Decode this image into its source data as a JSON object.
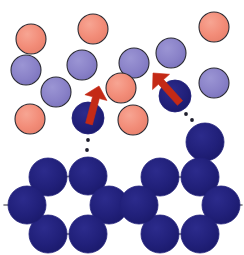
{
  "figure": {
    "title": "Monomer attachment to growing hexagonal framework",
    "caption": "",
    "width": 244,
    "height": 255,
    "background": "#ffffff"
  },
  "palette": {
    "monomer_pink": "#F28C78",
    "monomer_purple": "#8A82C8",
    "framework_blue": "#21207A",
    "circle_outline": "#2B2B33",
    "bond_line": "#6E6E78",
    "arrow_red": "#C42A16",
    "dotted_guide": "#1E1E2D"
  },
  "legend": {
    "pink_label": "pink monomer",
    "purple_label": "purple monomer",
    "blue_label": "incorporated unit",
    "arrow_label": "attachment direction",
    "dotted_label": "attachment pathway"
  },
  "geometry": {
    "solution_radius": 15,
    "framework_radius": 19,
    "outline_width": 1.1,
    "bond_width": 1.6,
    "dot_radius": 1.9
  },
  "solution_particles": [
    {
      "name": "pink-monomer-1",
      "type": "pink",
      "cx": 31,
      "cy": 39,
      "r": 15
    },
    {
      "name": "pink-monomer-2",
      "type": "pink",
      "cx": 93,
      "cy": 29,
      "r": 15
    },
    {
      "name": "pink-monomer-3",
      "type": "pink",
      "cx": 214,
      "cy": 27,
      "r": 15
    },
    {
      "name": "purple-monomer-1",
      "type": "purple",
      "cx": 26,
      "cy": 70,
      "r": 15
    },
    {
      "name": "purple-monomer-2",
      "type": "purple",
      "cx": 82,
      "cy": 65,
      "r": 15
    },
    {
      "name": "purple-monomer-3",
      "type": "purple",
      "cx": 134,
      "cy": 63,
      "r": 15
    },
    {
      "name": "purple-monomer-4",
      "type": "purple",
      "cx": 171,
      "cy": 53,
      "r": 15
    },
    {
      "name": "purple-monomer-5",
      "type": "purple",
      "cx": 56,
      "cy": 92,
      "r": 15
    },
    {
      "name": "pink-monomer-4",
      "type": "pink",
      "cx": 121,
      "cy": 88,
      "r": 15
    },
    {
      "name": "purple-monomer-6",
      "type": "purple",
      "cx": 214,
      "cy": 83,
      "r": 15
    },
    {
      "name": "pink-monomer-5",
      "type": "pink",
      "cx": 30,
      "cy": 119,
      "r": 15
    },
    {
      "name": "pink-monomer-6",
      "type": "pink",
      "cx": 133,
      "cy": 120,
      "r": 15
    }
  ],
  "attaching_units": [
    {
      "name": "attaching-unit-left",
      "cx": 88,
      "cy": 118,
      "r": 16
    },
    {
      "name": "attaching-unit-right",
      "cx": 175,
      "cy": 96,
      "r": 16
    }
  ],
  "arrows": [
    {
      "name": "attachment-arrow-left",
      "from_x": 89,
      "from_y": 124,
      "to_x": 99,
      "to_y": 86,
      "width": 7,
      "head": 12,
      "angle_deg": 75
    },
    {
      "name": "attachment-arrow-right",
      "from_x": 180,
      "from_y": 103,
      "to_x": 153,
      "to_y": 73,
      "width": 7,
      "head": 12,
      "angle_deg": 132
    }
  ],
  "guide_dots": [
    {
      "name": "guide-dot-left-1",
      "cx": 88,
      "cy": 140
    },
    {
      "name": "guide-dot-left-2",
      "cx": 87,
      "cy": 150
    },
    {
      "name": "guide-dot-left-3",
      "cx": 86,
      "cy": 160
    },
    {
      "name": "guide-dot-right-1",
      "cx": 186,
      "cy": 114
    },
    {
      "name": "guide-dot-right-2",
      "cx": 192,
      "cy": 120
    },
    {
      "name": "guide-dot-right-3",
      "cx": 199,
      "cy": 126
    }
  ],
  "framework_nodes": [
    {
      "name": "node-pendant-right",
      "cx": 205,
      "cy": 142,
      "r": 19,
      "ring": "pendant"
    },
    {
      "name": "node-L1",
      "cx": 48,
      "cy": 177,
      "r": 19,
      "ring": "left"
    },
    {
      "name": "node-L2",
      "cx": 88,
      "cy": 176,
      "r": 19,
      "ring": "left"
    },
    {
      "name": "node-L3",
      "cx": 109,
      "cy": 205,
      "r": 19,
      "ring": "left"
    },
    {
      "name": "node-L4",
      "cx": 88,
      "cy": 234,
      "r": 19,
      "ring": "left"
    },
    {
      "name": "node-L5",
      "cx": 48,
      "cy": 234,
      "r": 19,
      "ring": "left"
    },
    {
      "name": "node-L6",
      "cx": 27,
      "cy": 205,
      "r": 19,
      "ring": "left"
    },
    {
      "name": "node-R1",
      "cx": 160,
      "cy": 177,
      "r": 19,
      "ring": "right"
    },
    {
      "name": "node-R2",
      "cx": 200,
      "cy": 177,
      "r": 19,
      "ring": "right"
    },
    {
      "name": "node-R3",
      "cx": 221,
      "cy": 205,
      "r": 19,
      "ring": "right"
    },
    {
      "name": "node-R4",
      "cx": 200,
      "cy": 234,
      "r": 19,
      "ring": "right"
    },
    {
      "name": "node-R5",
      "cx": 160,
      "cy": 234,
      "r": 19,
      "ring": "right"
    },
    {
      "name": "node-R6",
      "cx": 139,
      "cy": 205,
      "r": 19,
      "ring": "right"
    }
  ],
  "framework_bonds": [
    {
      "name": "bond-L1-L2",
      "x1": 48,
      "y1": 177,
      "x2": 88,
      "y2": 176
    },
    {
      "name": "bond-L2-L3",
      "x1": 88,
      "y1": 176,
      "x2": 109,
      "y2": 205
    },
    {
      "name": "bond-L3-L4",
      "x1": 109,
      "y1": 205,
      "x2": 88,
      "y2": 234
    },
    {
      "name": "bond-L4-L5",
      "x1": 88,
      "y1": 234,
      "x2": 48,
      "y2": 234
    },
    {
      "name": "bond-L5-L6",
      "x1": 48,
      "y1": 234,
      "x2": 27,
      "y2": 205
    },
    {
      "name": "bond-L6-L1",
      "x1": 27,
      "y1": 205,
      "x2": 48,
      "y2": 177
    },
    {
      "name": "bond-R1-R2",
      "x1": 160,
      "y1": 177,
      "x2": 200,
      "y2": 177
    },
    {
      "name": "bond-R2-R3",
      "x1": 200,
      "y1": 177,
      "x2": 221,
      "y2": 205
    },
    {
      "name": "bond-R3-R4",
      "x1": 221,
      "y1": 205,
      "x2": 200,
      "y2": 234
    },
    {
      "name": "bond-R4-R5",
      "x1": 200,
      "y1": 234,
      "x2": 160,
      "y2": 234
    },
    {
      "name": "bond-R5-R6",
      "x1": 160,
      "y1": 234,
      "x2": 139,
      "y2": 205
    },
    {
      "name": "bond-R6-R1",
      "x1": 139,
      "y1": 205,
      "x2": 160,
      "y2": 177
    },
    {
      "name": "bond-bridge-L3-R6",
      "x1": 109,
      "y1": 205,
      "x2": 139,
      "y2": 205
    },
    {
      "name": "bond-pendant-R2",
      "x1": 205,
      "y1": 142,
      "x2": 200,
      "y2": 177
    },
    {
      "name": "bond-edge-left",
      "x1": 27,
      "y1": 205,
      "x2": 4,
      "y2": 205
    },
    {
      "name": "bond-edge-right",
      "x1": 221,
      "y1": 205,
      "x2": 242,
      "y2": 205
    },
    {
      "name": "bond-pendant-up",
      "x1": 205,
      "y1": 142,
      "x2": 212,
      "y2": 126
    }
  ]
}
